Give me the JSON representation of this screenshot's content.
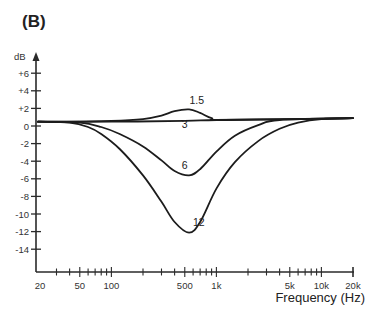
{
  "panel_label": "(B)",
  "chart_data": {
    "type": "line",
    "title": "(B)",
    "xlabel": "Frequency (Hz)",
    "ylabel": "dB",
    "x_scale": "log",
    "xlim": [
      20,
      20000
    ],
    "ylim": [
      -16,
      7
    ],
    "grid": false,
    "legend": null,
    "x_tick_labels": [
      "20",
      "50",
      "100",
      "500",
      "1k",
      "5k",
      "10k",
      "20k"
    ],
    "x_tick_values": [
      20,
      50,
      100,
      500,
      1000,
      5000,
      10000,
      20000
    ],
    "y_tick_labels": [
      "+6",
      "+4",
      "+2",
      "0",
      "-2",
      "-4",
      "-6",
      "-8",
      "-10",
      "-12",
      "-14"
    ],
    "y_tick_values": [
      6,
      4,
      2,
      0,
      -2,
      -4,
      -6,
      -8,
      -10,
      -12,
      -14
    ],
    "series": [
      {
        "name": "1.5",
        "x": [
          20,
          100,
          200,
          300,
          400,
          550,
          700,
          900,
          1200,
          20000
        ],
        "y": [
          0.6,
          0.7,
          0.9,
          1.3,
          1.8,
          2.0,
          1.6,
          1.0,
          0.8,
          1.0
        ]
      },
      {
        "name": "3",
        "x": [
          20,
          100,
          500,
          1000,
          5000,
          20000
        ],
        "y": [
          0.6,
          0.6,
          0.7,
          0.8,
          0.9,
          1.0
        ]
      },
      {
        "name": "6",
        "x": [
          20,
          50,
          80,
          120,
          200,
          300,
          400,
          550,
          700,
          1000,
          1500,
          2500,
          4000,
          20000
        ],
        "y": [
          0.6,
          0.5,
          0.0,
          -0.8,
          -2.2,
          -3.8,
          -5.0,
          -5.5,
          -4.8,
          -2.8,
          -1.0,
          0.2,
          0.8,
          1.0
        ]
      },
      {
        "name": "12",
        "x": [
          20,
          40,
          60,
          80,
          120,
          200,
          300,
          400,
          550,
          700,
          1000,
          1500,
          2500,
          4000,
          6000,
          10000,
          20000
        ],
        "y": [
          0.6,
          0.5,
          0.0,
          -0.8,
          -2.5,
          -5.5,
          -8.5,
          -10.8,
          -12.0,
          -10.8,
          -7.0,
          -4.0,
          -1.6,
          -0.2,
          0.5,
          0.9,
          1.0
        ]
      }
    ],
    "annotations": [
      {
        "text": "1.5",
        "x": 650,
        "y": 2.6
      },
      {
        "text": "3",
        "x": 500,
        "y": -0.1
      },
      {
        "text": "6",
        "x": 500,
        "y": -4.8
      },
      {
        "text": "12",
        "x": 680,
        "y": -11.3
      }
    ]
  }
}
